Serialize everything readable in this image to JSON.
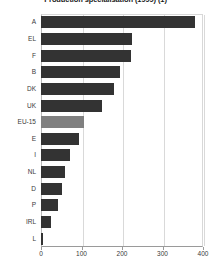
{
  "chart_data": {
    "type": "bar",
    "orientation": "horizontal",
    "title": "Production specialisation (1999) (1)",
    "xlabel": "",
    "ylabel": "",
    "categories": [
      "A",
      "EL",
      "F",
      "B",
      "DK",
      "UK",
      "EU-15",
      "E",
      "I",
      "NL",
      "D",
      "P",
      "IRL",
      "L"
    ],
    "values": [
      380,
      225,
      223,
      195,
      180,
      150,
      105,
      95,
      72,
      60,
      52,
      42,
      25,
      5
    ],
    "highlight_category": "EU-15",
    "xlim": [
      0,
      400
    ],
    "xticks": [
      0,
      100,
      200,
      300,
      400
    ],
    "xtick_labels": [
      "0",
      "100",
      "200",
      "300",
      "400"
    ],
    "grid": true,
    "grid_axis": "x",
    "legend": null,
    "bar_color": "#333333",
    "highlight_color": "#808080"
  }
}
